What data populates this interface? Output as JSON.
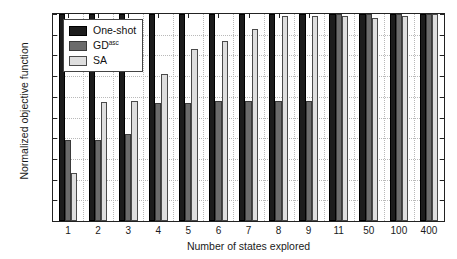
{
  "chart_data": {
    "type": "bar",
    "title": "",
    "xlabel": "Number of states explored",
    "ylabel": "Normalized objective function",
    "categories": [
      "1",
      "2",
      "3",
      "4",
      "5",
      "6",
      "7",
      "8",
      "9",
      "11",
      "50",
      "100",
      "400"
    ],
    "ylim": [
      0,
      1
    ],
    "yticks": [
      "0",
      "0.1",
      "0.2",
      "0.3",
      "0.4",
      "0.5",
      "0.6",
      "0.7",
      "0.8",
      "0.9",
      "1"
    ],
    "ytick_values": [
      0,
      0.1,
      0.2,
      0.3,
      0.4,
      0.5,
      0.6,
      0.7,
      0.8,
      0.9,
      1
    ],
    "grid": true,
    "legend_position": "upper-left",
    "series": [
      {
        "name": "One-shot",
        "name_sup": "",
        "color": "#1c1c1c",
        "values": [
          1.0,
          1.0,
          1.0,
          1.0,
          1.0,
          1.0,
          1.0,
          1.0,
          1.0,
          1.0,
          1.0,
          1.0,
          1.0
        ]
      },
      {
        "name": "GD",
        "name_sup": "asc",
        "color": "#6b6b6b",
        "values": [
          0.39,
          0.39,
          0.42,
          0.57,
          0.57,
          0.58,
          0.58,
          0.58,
          0.58,
          1.0,
          1.0,
          1.0,
          1.0
        ]
      },
      {
        "name": "SA",
        "name_sup": "",
        "color": "#dedede",
        "values": [
          0.23,
          0.575,
          0.58,
          0.71,
          0.83,
          0.87,
          0.93,
          0.99,
          0.99,
          0.99,
          0.98,
          0.99,
          1.0
        ]
      }
    ]
  }
}
